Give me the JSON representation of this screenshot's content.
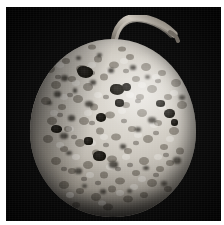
{
  "image": {
    "kind": "photograph",
    "subject": "fruit-with-spots",
    "description": "Black and white photograph of a round fruit with a short curved stem, its rind covered with many dark sunken lesions",
    "color_mode": "grayscale",
    "background_color": "#0a0a0a",
    "page_color": "#ffffff",
    "fruit_color_light": "#e6e3dd",
    "fruit_color_mid": "#bfbab1",
    "fruit_color_dark": "#3b3833",
    "lesion_color": "#17150f",
    "stem_color": "#8c867c",
    "caption": "",
    "title": "",
    "alt_text": "Round fruit with dark lesion spots on a black background"
  },
  "layout": {
    "width": 224,
    "height": 225,
    "border_top": 7,
    "border_left": 6,
    "border_right": 3,
    "border_bottom": 4
  },
  "fruit": {
    "center_x": 107,
    "center_y": 121,
    "radius_x": 83,
    "radius_y": 89,
    "stem_label": "stem",
    "highlight_label": "specular-highlight"
  },
  "lesions": [
    {
      "x": 47.0,
      "y": 27.0,
      "w": 13.0,
      "h": 10.0,
      "soft": false
    },
    {
      "x": 31.0,
      "y": 36.0,
      "w": 7.0,
      "h": 6.0,
      "soft": true
    },
    {
      "x": 60.0,
      "y": 41.0,
      "w": 6.0,
      "h": 5.0,
      "soft": true
    },
    {
      "x": 42.5,
      "y": 49.0,
      "w": 5.0,
      "h": 5.0,
      "soft": true
    },
    {
      "x": 48.0,
      "y": 27.5,
      "w": 15.0,
      "h": 11.0,
      "soft": false
    },
    {
      "x": 78.0,
      "y": 29.0,
      "w": 5.5,
      "h": 5.0,
      "soft": true
    },
    {
      "x": 46.0,
      "y": 17.0,
      "w": 5.0,
      "h": 4.5,
      "soft": true
    },
    {
      "x": 24.0,
      "y": 52.0,
      "w": 6.5,
      "h": 5.5,
      "soft": true
    },
    {
      "x": 17.0,
      "y": 62.0,
      "w": 5.0,
      "h": 4.5,
      "soft": true
    },
    {
      "x": 55.0,
      "y": 62.0,
      "w": 7.5,
      "h": 6.0,
      "soft": true
    },
    {
      "x": 80.0,
      "y": 45.0,
      "w": 14.0,
      "h": 11.0,
      "soft": false
    },
    {
      "x": 85.0,
      "y": 60.0,
      "w": 9.5,
      "h": 8.0,
      "soft": false
    },
    {
      "x": 92.0,
      "y": 43.5,
      "w": 8.5,
      "h": 8.0,
      "soft": false
    },
    {
      "x": 66.0,
      "y": 74.0,
      "w": 10.0,
      "h": 8.5,
      "soft": false
    },
    {
      "x": 38.0,
      "y": 76.0,
      "w": 7.0,
      "h": 6.0,
      "soft": true
    },
    {
      "x": 21.0,
      "y": 86.0,
      "w": 11.0,
      "h": 8.0,
      "soft": false
    },
    {
      "x": 30.0,
      "y": 94.0,
      "w": 8.0,
      "h": 6.0,
      "soft": true
    },
    {
      "x": 54.0,
      "y": 98.0,
      "w": 9.0,
      "h": 7.5,
      "soft": false
    },
    {
      "x": 63.0,
      "y": 112.0,
      "w": 13.0,
      "h": 10.0,
      "soft": false
    },
    {
      "x": 79.0,
      "y": 122.0,
      "w": 9.0,
      "h": 7.0,
      "soft": true
    },
    {
      "x": 45.0,
      "y": 129.0,
      "w": 6.5,
      "h": 5.5,
      "soft": true
    },
    {
      "x": 90.0,
      "y": 105.0,
      "w": 6.0,
      "h": 5.0,
      "soft": true
    },
    {
      "x": 105.0,
      "y": 88.0,
      "w": 6.0,
      "h": 5.0,
      "soft": true
    },
    {
      "x": 126.0,
      "y": 61.0,
      "w": 9.0,
      "h": 7.0,
      "soft": false
    },
    {
      "x": 134.0,
      "y": 70.0,
      "w": 10.5,
      "h": 8.5,
      "soft": false
    },
    {
      "x": 141.0,
      "y": 80.0,
      "w": 7.0,
      "h": 6.5,
      "soft": false
    },
    {
      "x": 118.0,
      "y": 78.0,
      "w": 7.5,
      "h": 6.0,
      "soft": true
    },
    {
      "x": 149.0,
      "y": 56.0,
      "w": 6.0,
      "h": 5.0,
      "soft": true
    },
    {
      "x": 143.0,
      "y": 118.0,
      "w": 8.0,
      "h": 6.5,
      "soft": true
    },
    {
      "x": 131.0,
      "y": 142.0,
      "w": 5.5,
      "h": 5.0,
      "soft": true
    },
    {
      "x": 97.0,
      "y": 150.0,
      "w": 5.0,
      "h": 4.0,
      "soft": true
    },
    {
      "x": 52.0,
      "y": 145.0,
      "w": 5.0,
      "h": 4.5,
      "soft": true
    },
    {
      "x": 113.0,
      "y": 127.0,
      "w": 5.5,
      "h": 4.5,
      "soft": true
    },
    {
      "x": 70.0,
      "y": 150.0,
      "w": 6.0,
      "h": 5.0,
      "soft": true
    },
    {
      "x": 36.0,
      "y": 112.0,
      "w": 5.5,
      "h": 4.5,
      "soft": true
    },
    {
      "x": 100.0,
      "y": 26.0,
      "w": 6.0,
      "h": 5.0,
      "soft": true
    },
    {
      "x": 115.0,
      "y": 36.0,
      "w": 5.0,
      "h": 4.5,
      "soft": true
    },
    {
      "x": 67.0,
      "y": 14.0,
      "w": 5.0,
      "h": 4.0,
      "soft": true
    }
  ]
}
